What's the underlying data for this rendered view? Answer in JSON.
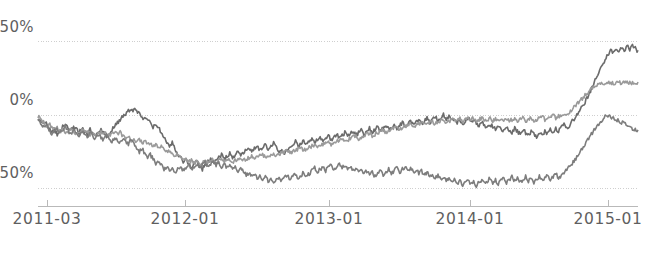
{
  "chart_data": {
    "type": "line",
    "title": "",
    "subtitle": "",
    "xlabel": "",
    "ylabel": "",
    "grid": true,
    "legend": "none",
    "xlim": [
      0,
      100
    ],
    "ylim": [
      -62,
      58
    ],
    "y_ticks": [
      {
        "value": 50,
        "label": "50%"
      },
      {
        "value": 0,
        "label": "0%"
      },
      {
        "value": -50,
        "label": "-50%"
      }
    ],
    "x_ticks": [
      {
        "pos": 1.5,
        "label": "2011-03"
      },
      {
        "pos": 24.5,
        "label": "2012-01"
      },
      {
        "pos": 48.5,
        "label": "2013-01"
      },
      {
        "pos": 72.0,
        "label": "2014-01"
      },
      {
        "pos": 95.0,
        "label": "2015-01"
      }
    ],
    "x_axis_type": "date",
    "x_range_labels": [
      "2011-03",
      "2015-04"
    ],
    "series": [
      {
        "name": "series-1",
        "color": "#6b6b6b",
        "linewidth": 1.6,
        "values": [
          -2,
          -4,
          -6,
          -5,
          -9,
          -12,
          -10,
          -13,
          -11,
          -8,
          -6,
          -9,
          -11,
          -8,
          -10,
          -12,
          -9,
          -11,
          -13,
          -10,
          -12,
          -14,
          -11,
          -9,
          -12,
          -15,
          -13,
          -10,
          -7,
          -5,
          -3,
          -1,
          1,
          3,
          2,
          4,
          3,
          1,
          -1,
          -3,
          -2,
          -5,
          -8,
          -6,
          -9,
          -12,
          -15,
          -18,
          -21,
          -19,
          -23,
          -26,
          -29,
          -32,
          -30,
          -34,
          -36,
          -33,
          -31,
          -35,
          -37,
          -34,
          -32,
          -30,
          -33,
          -31,
          -29,
          -27,
          -30,
          -28,
          -26,
          -29,
          -27,
          -25,
          -28,
          -26,
          -24,
          -22,
          -25,
          -23,
          -21,
          -24,
          -22,
          -20,
          -23,
          -21,
          -19,
          -22,
          -25,
          -23,
          -26,
          -24,
          -22,
          -20,
          -18,
          -21,
          -19,
          -17,
          -20,
          -18,
          -16,
          -19,
          -17,
          -15,
          -18,
          -16,
          -14,
          -17,
          -15,
          -13,
          -16,
          -14,
          -12,
          -15,
          -13,
          -11,
          -14,
          -12,
          -10,
          -13,
          -11,
          -9,
          -12,
          -10,
          -8,
          -11,
          -9,
          -7,
          -10,
          -8,
          -6,
          -9,
          -7,
          -5,
          -8,
          -6,
          -4,
          -7,
          -5,
          -3,
          -6,
          -4,
          -2,
          -5,
          -3,
          -1,
          -4,
          -2,
          0,
          -3,
          -1,
          -4,
          -2,
          -5,
          -3,
          -6,
          -4,
          -2,
          -5,
          -3,
          -6,
          -8,
          -5,
          -7,
          -9,
          -6,
          -8,
          -10,
          -7,
          -9,
          -11,
          -8,
          -10,
          -12,
          -9,
          -11,
          -13,
          -10,
          -12,
          -14,
          -11,
          -13,
          -15,
          -12,
          -14,
          -11,
          -13,
          -10,
          -12,
          -9,
          -11,
          -8,
          -6,
          -9,
          -7,
          -4,
          -2,
          1,
          4,
          7,
          10,
          14,
          18,
          22,
          26,
          30,
          34,
          38,
          41,
          44,
          42,
          45,
          43,
          46,
          44,
          47,
          45,
          48,
          46,
          43
        ]
      },
      {
        "name": "series-2",
        "color": "#9a9a9a",
        "linewidth": 1.6,
        "values": [
          -1,
          -3,
          -5,
          -7,
          -6,
          -8,
          -10,
          -9,
          -11,
          -10,
          -12,
          -11,
          -9,
          -11,
          -13,
          -12,
          -10,
          -12,
          -11,
          -13,
          -12,
          -14,
          -13,
          -11,
          -13,
          -12,
          -14,
          -13,
          -11,
          -13,
          -12,
          -14,
          -16,
          -15,
          -17,
          -16,
          -18,
          -17,
          -19,
          -18,
          -20,
          -19,
          -21,
          -20,
          -22,
          -21,
          -23,
          -25,
          -24,
          -26,
          -28,
          -27,
          -29,
          -31,
          -30,
          -32,
          -31,
          -33,
          -32,
          -34,
          -33,
          -31,
          -33,
          -32,
          -30,
          -32,
          -31,
          -30,
          -32,
          -31,
          -30,
          -32,
          -31,
          -30,
          -29,
          -31,
          -30,
          -29,
          -28,
          -30,
          -29,
          -28,
          -27,
          -29,
          -28,
          -27,
          -26,
          -28,
          -27,
          -26,
          -25,
          -24,
          -26,
          -25,
          -24,
          -23,
          -22,
          -24,
          -23,
          -22,
          -21,
          -20,
          -22,
          -21,
          -20,
          -19,
          -18,
          -20,
          -19,
          -18,
          -17,
          -16,
          -18,
          -17,
          -16,
          -15,
          -14,
          -16,
          -15,
          -14,
          -13,
          -12,
          -14,
          -13,
          -12,
          -11,
          -10,
          -12,
          -11,
          -10,
          -9,
          -8,
          -10,
          -9,
          -8,
          -7,
          -6,
          -8,
          -7,
          -6,
          -5,
          -7,
          -6,
          -5,
          -4,
          -6,
          -5,
          -4,
          -3,
          -5,
          -4,
          -3,
          -4,
          -3,
          -2,
          -4,
          -3,
          -2,
          -3,
          -2,
          -4,
          -3,
          -2,
          -4,
          -3,
          -2,
          -4,
          -3,
          -2,
          -4,
          -3,
          -2,
          -4,
          -3,
          -2,
          -4,
          -3,
          -2,
          -4,
          -3,
          -2,
          -4,
          -3,
          -2,
          -1,
          -3,
          -2,
          -1,
          0,
          -2,
          -1,
          0,
          1,
          0,
          2,
          4,
          6,
          8,
          10,
          12,
          14,
          16,
          18,
          20,
          21,
          22,
          22,
          22,
          22,
          22,
          22,
          22,
          22,
          22,
          22,
          22,
          22,
          22,
          22,
          22
        ]
      },
      {
        "name": "series-3",
        "color": "#7d7d7d",
        "linewidth": 1.6,
        "values": [
          -3,
          -5,
          -8,
          -6,
          -10,
          -13,
          -11,
          -9,
          -12,
          -10,
          -8,
          -11,
          -13,
          -10,
          -12,
          -14,
          -11,
          -13,
          -15,
          -12,
          -14,
          -16,
          -13,
          -15,
          -17,
          -14,
          -16,
          -18,
          -15,
          -17,
          -19,
          -16,
          -18,
          -20,
          -17,
          -19,
          -22,
          -25,
          -23,
          -26,
          -29,
          -27,
          -30,
          -33,
          -31,
          -34,
          -37,
          -35,
          -38,
          -36,
          -39,
          -37,
          -35,
          -38,
          -36,
          -34,
          -37,
          -35,
          -33,
          -36,
          -34,
          -32,
          -35,
          -33,
          -31,
          -34,
          -32,
          -35,
          -33,
          -36,
          -34,
          -37,
          -35,
          -38,
          -36,
          -39,
          -41,
          -39,
          -42,
          -40,
          -43,
          -41,
          -44,
          -42,
          -45,
          -43,
          -46,
          -44,
          -42,
          -45,
          -43,
          -41,
          -44,
          -42,
          -40,
          -43,
          -41,
          -39,
          -42,
          -40,
          -38,
          -36,
          -39,
          -37,
          -35,
          -38,
          -36,
          -34,
          -37,
          -35,
          -33,
          -36,
          -34,
          -37,
          -35,
          -38,
          -36,
          -39,
          -37,
          -40,
          -38,
          -41,
          -39,
          -42,
          -40,
          -38,
          -41,
          -39,
          -37,
          -40,
          -38,
          -36,
          -39,
          -37,
          -35,
          -38,
          -36,
          -39,
          -37,
          -40,
          -38,
          -41,
          -39,
          -42,
          -40,
          -43,
          -41,
          -44,
          -42,
          -45,
          -43,
          -46,
          -44,
          -47,
          -45,
          -48,
          -46,
          -44,
          -47,
          -45,
          -48,
          -46,
          -44,
          -47,
          -45,
          -43,
          -46,
          -44,
          -47,
          -45,
          -43,
          -46,
          -44,
          -42,
          -45,
          -43,
          -46,
          -44,
          -42,
          -45,
          -43,
          -46,
          -44,
          -42,
          -45,
          -43,
          -41,
          -44,
          -42,
          -40,
          -43,
          -41,
          -39,
          -37,
          -35,
          -33,
          -31,
          -28,
          -25,
          -22,
          -19,
          -16,
          -13,
          -10,
          -7,
          -5,
          -3,
          -1,
          0,
          -1,
          -2,
          -3,
          -4,
          -5,
          -6,
          -7,
          -8,
          -9,
          -10,
          -11
        ]
      }
    ]
  },
  "axes": {
    "axis_color": "#b9b9b9",
    "grid_color": "#cfcfcf",
    "tick_label_color": "#5f5f5f"
  }
}
